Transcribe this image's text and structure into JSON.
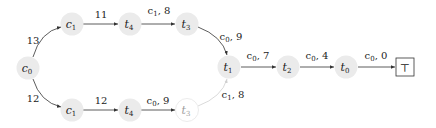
{
  "diagram": {
    "type": "directed-graph",
    "colors": {
      "node_fill": "#ebebeb",
      "edge": "#333333",
      "faded_edge": "#cfcfcf",
      "text": "#222222"
    },
    "nodes": [
      {
        "id": "c0",
        "label": "c0",
        "x": 28,
        "y": 68
      },
      {
        "id": "c1_top",
        "label": "c1",
        "x": 72,
        "y": 24
      },
      {
        "id": "t4_top",
        "label": "t4",
        "x": 130,
        "y": 24
      },
      {
        "id": "t3_top",
        "label": "t3",
        "x": 187,
        "y": 24
      },
      {
        "id": "c1_bot",
        "label": "c1",
        "x": 72,
        "y": 110
      },
      {
        "id": "t4_bot",
        "label": "t4",
        "x": 130,
        "y": 110
      },
      {
        "id": "t3_bot",
        "label": "t3",
        "x": 187,
        "y": 110,
        "faded": true
      },
      {
        "id": "t1",
        "label": "t1",
        "x": 229,
        "y": 67
      },
      {
        "id": "t2",
        "label": "t2",
        "x": 288,
        "y": 67
      },
      {
        "id": "t0",
        "label": "t0",
        "x": 346,
        "y": 67
      },
      {
        "id": "top",
        "label": "⊤",
        "x": 404,
        "y": 67,
        "shape": "box"
      }
    ],
    "edges": [
      {
        "from": "c0",
        "to": "c1_top",
        "label": "13"
      },
      {
        "from": "c1_top",
        "to": "t4_top",
        "label": "11"
      },
      {
        "from": "t4_top",
        "to": "t3_top",
        "label": "c1, 8"
      },
      {
        "from": "t3_top",
        "to": "t1",
        "label": "c0, 9"
      },
      {
        "from": "c0",
        "to": "c1_bot",
        "label": "12"
      },
      {
        "from": "c1_bot",
        "to": "t4_bot",
        "label": "12"
      },
      {
        "from": "t4_bot",
        "to": "t3_bot",
        "label": "c0, 9"
      },
      {
        "from": "t3_bot",
        "to": "t1",
        "label": "c1, 8",
        "faded": true
      },
      {
        "from": "t1",
        "to": "t2",
        "label": "c0, 7"
      },
      {
        "from": "t2",
        "to": "t0",
        "label": "c0, 4"
      },
      {
        "from": "t0",
        "to": "top",
        "label": "c0, 0"
      }
    ]
  },
  "labels": {
    "c0": {
      "base": "c",
      "sub": "0"
    },
    "c1_top": {
      "base": "c",
      "sub": "1"
    },
    "t4_top": {
      "base": "t",
      "sub": "4"
    },
    "t3_top": {
      "base": "t",
      "sub": "3"
    },
    "c1_bot": {
      "base": "c",
      "sub": "1"
    },
    "t4_bot": {
      "base": "t",
      "sub": "4"
    },
    "t3_bot": {
      "base": "t",
      "sub": "3"
    },
    "t1": {
      "base": "t",
      "sub": "1"
    },
    "t2": {
      "base": "t",
      "sub": "2"
    },
    "t0": {
      "base": "t",
      "sub": "0"
    },
    "top": "⊤",
    "e_c0_c1top": "13",
    "e_c1_t4_top": "11",
    "e_t4_t3_top": {
      "base": "c",
      "sub": "1",
      "rest": ", 8"
    },
    "e_t3_t1_top": {
      "base": "c",
      "sub": "0",
      "rest": ", 9"
    },
    "e_c0_c1bot": "12",
    "e_c1_t4_bot": "12",
    "e_t4_t3_bot": {
      "base": "c",
      "sub": "0",
      "rest": ", 9"
    },
    "e_t3_t1_bot": {
      "base": "c",
      "sub": "1",
      "rest": ", 8"
    },
    "e_t1_t2": {
      "base": "c",
      "sub": "0",
      "rest": ", 7"
    },
    "e_t2_t0": {
      "base": "c",
      "sub": "0",
      "rest": ", 4"
    },
    "e_t0_top": {
      "base": "c",
      "sub": "0",
      "rest": ", 0"
    }
  }
}
